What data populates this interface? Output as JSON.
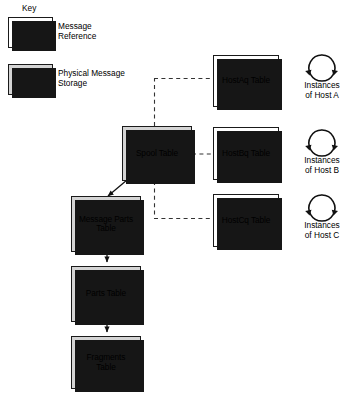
{
  "diagram": {
    "key": {
      "title": "Key",
      "entries": [
        {
          "style": "reference",
          "label": "Message\nReference"
        },
        {
          "style": "physical",
          "label": "Physical Message\nStorage"
        }
      ]
    },
    "nodes": {
      "spool": {
        "label": "Spool Table",
        "style": "physical"
      },
      "message_parts": {
        "label": "Message Parts\nTable",
        "style": "physical"
      },
      "parts": {
        "label": "Parts Table",
        "style": "physical"
      },
      "fragments": {
        "label": "Fragments\nTable",
        "style": "physical"
      },
      "hostaq": {
        "label": "HostAq Table",
        "style": "reference"
      },
      "hostbq": {
        "label": "HostBq Table",
        "style": "reference"
      },
      "hostcq": {
        "label": "HostCq Table",
        "style": "reference"
      }
    },
    "instances": [
      {
        "icon": "cycle-icon",
        "label": "Instances\nof Host A"
      },
      {
        "icon": "cycle-icon",
        "label": "Instances\nof Host B"
      },
      {
        "icon": "cycle-icon",
        "label": "Instances\nof Host C"
      }
    ],
    "colors": {
      "physical_fill": "#d4d4d4",
      "reference_fill": "#ffffff",
      "stroke": "#1a1a1a",
      "shadow": "#161616",
      "background": "#ffffff"
    }
  }
}
